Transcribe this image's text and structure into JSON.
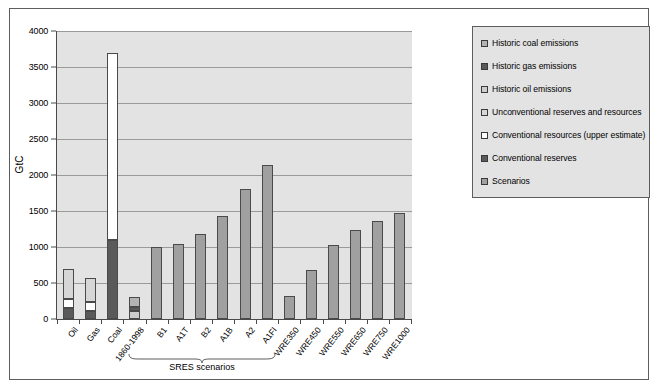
{
  "chart_data": {
    "type": "bar",
    "title": "",
    "xlabel": "",
    "ylabel": "GtC",
    "ylim": [
      0,
      4000
    ],
    "ytick_values": [
      0,
      500,
      1000,
      1500,
      2000,
      2500,
      3000,
      3500,
      4000
    ],
    "ytick_labels": [
      "0",
      "500",
      "1000",
      "1500",
      "2000",
      "2500",
      "3000",
      "3500",
      "4000"
    ],
    "grid": true,
    "legend_position": "right",
    "annotations": [
      {
        "text": "SRES scenarios",
        "covers": [
          "B1",
          "A1T",
          "B2",
          "A1B",
          "A2",
          "A1FI"
        ]
      }
    ],
    "legend": [
      {
        "label": "Historic coal emissions",
        "color": "#b3b3b3"
      },
      {
        "label": "Historic gas emissions",
        "color": "#5a5a5a"
      },
      {
        "label": "Historic oil emissions",
        "color": "#cdcdcd"
      },
      {
        "label": "Unconventional reserves and resources",
        "color": "#d6d6d6"
      },
      {
        "label": "Conventional resources (upper estimate)",
        "color": "#ffffff"
      },
      {
        "label": "Conventional reserves",
        "color": "#5a5a5a"
      },
      {
        "label": "Scenarios",
        "color": "#a0a0a0"
      }
    ],
    "categories": [
      "Oil",
      "Gas",
      "Coal",
      "1860-1998",
      "B1",
      "A1T",
      "B2",
      "A1B",
      "A2",
      "A1FI",
      "WRE350",
      "WRE450",
      "WRE550",
      "WRE650",
      "WRE750",
      "WRE1000"
    ],
    "bars": [
      {
        "category": "Oil",
        "total": 700,
        "segments": [
          {
            "series": "Conventional reserves",
            "value": 150,
            "color": "#5a5a5a"
          },
          {
            "series": "Conventional resources (upper estimate)",
            "value": 130,
            "color": "#ffffff"
          },
          {
            "series": "Unconventional reserves and resources",
            "value": 420,
            "color": "#d6d6d6"
          }
        ]
      },
      {
        "category": "Gas",
        "total": 565,
        "segments": [
          {
            "series": "Conventional reserves",
            "value": 110,
            "color": "#5a5a5a"
          },
          {
            "series": "Conventional resources (upper estimate)",
            "value": 130,
            "color": "#ffffff"
          },
          {
            "series": "Unconventional reserves and resources",
            "value": 325,
            "color": "#d6d6d6"
          }
        ]
      },
      {
        "category": "Coal",
        "total": 3700,
        "segments": [
          {
            "series": "Conventional reserves",
            "value": 1100,
            "color": "#5a5a5a"
          },
          {
            "series": "Conventional resources (upper estimate)",
            "value": 2600,
            "color": "#ffffff"
          }
        ]
      },
      {
        "category": "1860-1998",
        "total": 310,
        "segments": [
          {
            "series": "Historic oil emissions",
            "value": 105,
            "color": "#cdcdcd"
          },
          {
            "series": "Historic gas emissions",
            "value": 60,
            "color": "#5a5a5a"
          },
          {
            "series": "Historic coal emissions",
            "value": 145,
            "color": "#b3b3b3"
          }
        ]
      },
      {
        "category": "B1",
        "total": 995,
        "segments": [
          {
            "series": "Scenarios",
            "value": 995,
            "color": "#a0a0a0"
          }
        ]
      },
      {
        "category": "A1T",
        "total": 1045,
        "segments": [
          {
            "series": "Scenarios",
            "value": 1045,
            "color": "#a0a0a0"
          }
        ]
      },
      {
        "category": "B2",
        "total": 1175,
        "segments": [
          {
            "series": "Scenarios",
            "value": 1175,
            "color": "#a0a0a0"
          }
        ]
      },
      {
        "category": "A1B",
        "total": 1435,
        "segments": [
          {
            "series": "Scenarios",
            "value": 1435,
            "color": "#a0a0a0"
          }
        ]
      },
      {
        "category": "A2",
        "total": 1800,
        "segments": [
          {
            "series": "Scenarios",
            "value": 1800,
            "color": "#a0a0a0"
          }
        ]
      },
      {
        "category": "A1FI",
        "total": 2140,
        "segments": [
          {
            "series": "Scenarios",
            "value": 2140,
            "color": "#a0a0a0"
          }
        ]
      },
      {
        "category": "WRE350",
        "total": 320,
        "segments": [
          {
            "series": "Scenarios",
            "value": 320,
            "color": "#a0a0a0"
          }
        ]
      },
      {
        "category": "WRE450",
        "total": 680,
        "segments": [
          {
            "series": "Scenarios",
            "value": 680,
            "color": "#a0a0a0"
          }
        ]
      },
      {
        "category": "WRE550",
        "total": 1030,
        "segments": [
          {
            "series": "Scenarios",
            "value": 1030,
            "color": "#a0a0a0"
          }
        ]
      },
      {
        "category": "WRE650",
        "total": 1240,
        "segments": [
          {
            "series": "Scenarios",
            "value": 1240,
            "color": "#a0a0a0"
          }
        ]
      },
      {
        "category": "WRE750",
        "total": 1360,
        "segments": [
          {
            "series": "Scenarios",
            "value": 1360,
            "color": "#a0a0a0"
          }
        ]
      },
      {
        "category": "WRE1000",
        "total": 1470,
        "segments": [
          {
            "series": "Scenarios",
            "value": 1470,
            "color": "#a0a0a0"
          }
        ]
      }
    ]
  },
  "style": {
    "plot_background": "#e3e3e3",
    "legend_background": "#e3e3e3",
    "gridline_color": "#9a9a9a",
    "axis_color": "#4a4a4a",
    "frame_color": "#5d5d5d",
    "page_background": "#ffffff"
  }
}
